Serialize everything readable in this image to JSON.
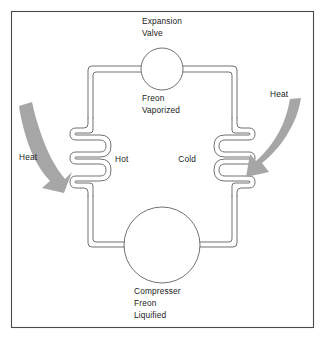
{
  "diagram": {
    "type": "refrigeration-cycle-schematic",
    "background_color": "#ffffff",
    "frame_color": "#4a4a4a",
    "pipe_color": "#58585a",
    "arrow_color": "#a6a6a6",
    "text_color": "#1a1a1a",
    "labels": {
      "expansion_valve_line1": "Expansion",
      "expansion_valve_line2": "Valve",
      "freon_vaporized_line1": "Freon",
      "freon_vaporized_line2": "Vaporized",
      "hot": "Hot",
      "cold": "Cold",
      "heat_left": "Heat",
      "heat_right": "Heat",
      "compressor_line1": "Compresser",
      "compressor_line2": "Freon",
      "compressor_line3": "Liquified"
    },
    "components": [
      {
        "name": "expansion-valve",
        "shape": "circle",
        "cx": 162,
        "cy": 69,
        "r": 21
      },
      {
        "name": "compressor",
        "shape": "circle",
        "cx": 162,
        "cy": 245,
        "r": 38
      },
      {
        "name": "hot-coil",
        "shape": "serpentine",
        "side": "left",
        "loops": 4
      },
      {
        "name": "cold-coil",
        "shape": "serpentine",
        "side": "right",
        "loops": 4
      }
    ],
    "arrows": [
      {
        "name": "heat-out-arrow",
        "direction": "up-left",
        "meaning": "heat rejected from hot coil"
      },
      {
        "name": "heat-in-arrow",
        "direction": "down-left",
        "meaning": "heat absorbed into cold coil"
      }
    ]
  }
}
